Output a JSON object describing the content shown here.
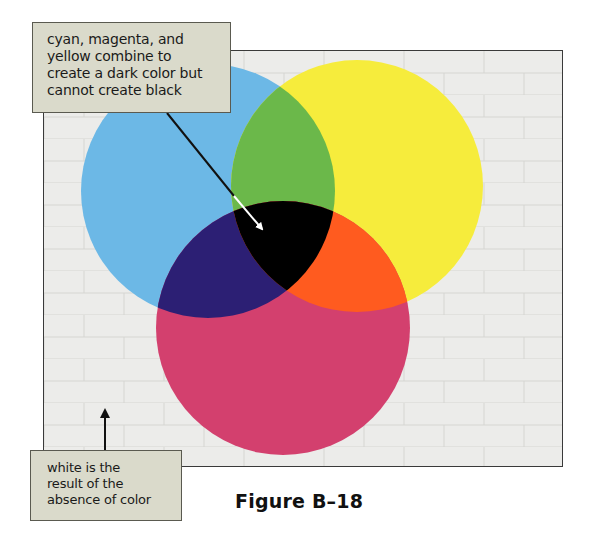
{
  "figure": {
    "caption": "Figure B–18",
    "background_color": "#ececea",
    "frame_border_color": "#3a3a3a"
  },
  "callouts": {
    "top": {
      "lines": [
        "cyan, magenta, and",
        "yellow combine to",
        "create a dark color but",
        "cannot create black"
      ]
    },
    "bottom": {
      "lines": [
        "white is the",
        "result of the",
        "absence of color"
      ]
    }
  },
  "circles": [
    {
      "name": "cyan",
      "color": "#6cb8e6"
    },
    {
      "name": "yellow",
      "color": "#f6ec3c"
    },
    {
      "name": "magenta",
      "color": "#d3406e"
    }
  ],
  "overlaps": [
    {
      "name": "cyan+yellow",
      "color": "#6bb84a"
    },
    {
      "name": "cyan+magenta",
      "color": "#2c1f74"
    },
    {
      "name": "yellow+magenta",
      "color": "#ff5b1f"
    },
    {
      "name": "cyan+yellow+magenta",
      "color": "#000000"
    }
  ]
}
